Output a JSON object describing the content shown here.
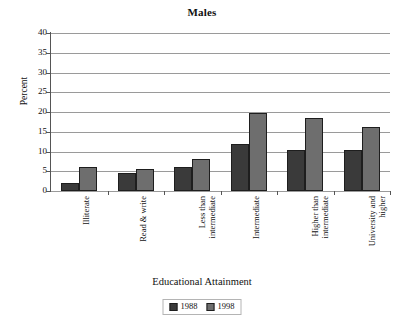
{
  "chart_data": {
    "type": "bar",
    "title": "Males",
    "xlabel": "Educational Attainment",
    "ylabel": "Percent",
    "ylim": [
      0,
      40
    ],
    "yticks": [
      40,
      35,
      30,
      25,
      20,
      15,
      10,
      5,
      0
    ],
    "grid": true,
    "legend_position": "bottom",
    "categories": [
      "Illiterate",
      "Read & write",
      "Less than intermediate",
      "Intermediate",
      "Higher than intermediate",
      "University and higher"
    ],
    "category_lines": [
      [
        "Illiterate"
      ],
      [
        "Read & write"
      ],
      [
        "Less than",
        "intermediate"
      ],
      [
        "Intermediate"
      ],
      [
        "Higher than",
        "intermediate"
      ],
      [
        "University and",
        "higher"
      ]
    ],
    "series": [
      {
        "name": "1988",
        "color": "#3a3a3a",
        "values": [
          2,
          4.6,
          6.1,
          12,
          10.3,
          10.5
        ]
      },
      {
        "name": "1998",
        "color": "#6e6e6e",
        "values": [
          6.1,
          5.5,
          8.2,
          19.7,
          18.6,
          16.3
        ]
      }
    ]
  },
  "colors": {
    "series_1988": "#3a3a3a",
    "series_1998": "#6e6e6e",
    "gridline": "#9a9a9a",
    "axis": "#555555",
    "background": "#ffffff"
  }
}
